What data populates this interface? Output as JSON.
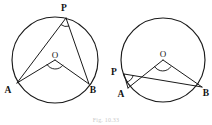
{
  "figure": {
    "caption": "Fig. 10.33",
    "stroke_color": "#1a1a1a",
    "label_color": "#131313",
    "background": "#ffffff"
  },
  "diagrams": [
    {
      "id": "left-circle-major-arc",
      "description": "Circle with centre O, chord AB, and point P on the major arc; angle AOB at centre and angle APB at circumference",
      "circle": {
        "cx": 55,
        "cy": 60,
        "r": 43
      },
      "points": {
        "P": {
          "x": 66,
          "y": 18,
          "label": "P",
          "label_x": 64,
          "label_y": 11
        },
        "O": {
          "x": 55,
          "y": 60,
          "label": "O",
          "label_x": 51,
          "label_y": 58
        },
        "A": {
          "x": 17,
          "y": 83,
          "label": "A",
          "label_x": 6,
          "label_y": 92
        },
        "B": {
          "x": 89,
          "y": 84,
          "label": "B",
          "label_x": 90,
          "label_y": 92
        }
      },
      "segments": [
        {
          "name": "PA",
          "from": "P",
          "to": "A"
        },
        {
          "name": "PB",
          "from": "P",
          "to": "B"
        },
        {
          "name": "OA",
          "from": "O",
          "to": "A"
        },
        {
          "name": "OB",
          "from": "O",
          "to": "B"
        }
      ],
      "angle_marks": [
        {
          "at": "P",
          "name": "angle-apb-mark",
          "kind": "arc"
        },
        {
          "at": "O",
          "name": "angle-aob-mark",
          "kind": "arc"
        }
      ]
    },
    {
      "id": "right-circle-minor-arc",
      "description": "Circle with centre O, chord AB, and point P on the minor arc near A; angle AOB at centre and angle APB at circumference",
      "circle": {
        "cx": 163,
        "cy": 60,
        "r": 42
      },
      "points": {
        "P": {
          "x": 124,
          "y": 74,
          "label": "P",
          "label_x": 112,
          "label_y": 72
        },
        "O": {
          "x": 163,
          "y": 60,
          "label": "O",
          "label_x": 159,
          "label_y": 57
        },
        "A": {
          "x": 128,
          "y": 88,
          "label": "A",
          "label_x": 119,
          "label_y": 96
        },
        "B": {
          "x": 202,
          "y": 87,
          "label": "B",
          "label_x": 203,
          "label_y": 95
        }
      },
      "segments": [
        {
          "name": "PA",
          "from": "P",
          "to": "A"
        },
        {
          "name": "PB",
          "from": "P",
          "to": "B"
        },
        {
          "name": "OA",
          "from": "O",
          "to": "A"
        },
        {
          "name": "OB",
          "from": "O",
          "to": "B"
        }
      ],
      "angle_marks": [
        {
          "at": "P",
          "name": "angle-apb-mark",
          "kind": "arc"
        },
        {
          "at": "O",
          "name": "angle-aob-mark",
          "kind": "arc"
        }
      ]
    }
  ]
}
